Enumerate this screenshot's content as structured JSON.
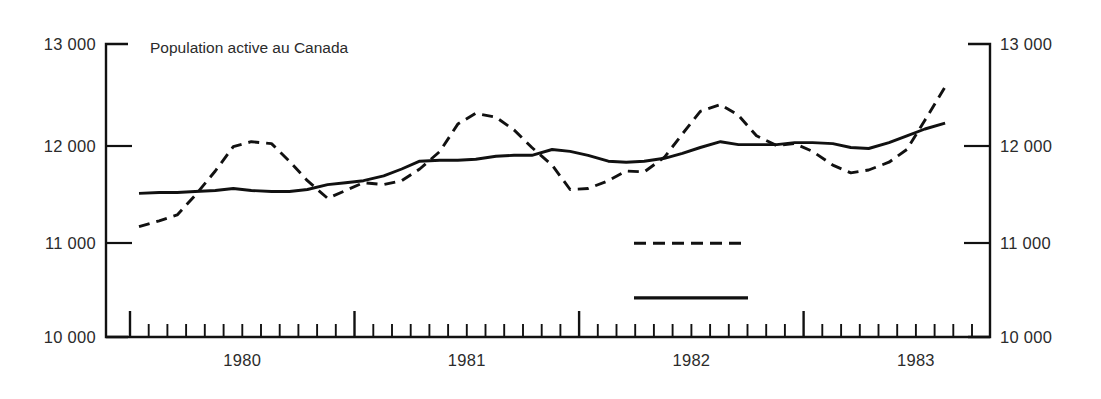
{
  "chart_data": {
    "type": "line",
    "title": "Population active au Canada",
    "xlabel": "",
    "ylabel": "",
    "ylim": [
      10000,
      13000
    ],
    "yticks": [
      10000,
      11000,
      12000,
      13000
    ],
    "ytick_labels": [
      "10 000",
      "11 000",
      "12 000",
      "13 000"
    ],
    "ytick_labels_right": [
      "10 000",
      "11 000",
      "12 000",
      "13 000"
    ],
    "xlim": [
      1979.5,
      1983.33
    ],
    "xticks": [
      1980,
      1981,
      1982,
      1983
    ],
    "xtick_labels": [
      "1980",
      "1981",
      "1982",
      "1983"
    ],
    "minor_tick_interval_months": 1,
    "year_boundary_ticks": [
      1979.5,
      1980.5,
      1981.5,
      1982.5,
      1983.33
    ],
    "grid": false,
    "legend_position": "inside-bottom-center",
    "legend_labels_visible": false,
    "series": [
      {
        "name": "donnees-brutes",
        "style": "dashed",
        "color": "#111111",
        "x": [
          1979.54,
          1979.63,
          1979.71,
          1979.79,
          1979.88,
          1979.96,
          1980.04,
          1980.13,
          1980.21,
          1980.29,
          1980.38,
          1980.46,
          1980.54,
          1980.63,
          1980.71,
          1980.79,
          1980.88,
          1980.96,
          1981.04,
          1981.13,
          1981.21,
          1981.29,
          1981.38,
          1981.46,
          1981.54,
          1981.63,
          1981.71,
          1981.79,
          1981.88,
          1981.96,
          1982.04,
          1982.13,
          1982.21,
          1982.29,
          1982.38,
          1982.46,
          1982.54,
          1982.63,
          1982.71,
          1982.79,
          1982.88,
          1982.96,
          1983.04,
          1983.13
        ],
        "values": [
          11130,
          11190,
          11250,
          11450,
          11700,
          11950,
          12000,
          11980,
          11800,
          11600,
          11420,
          11500,
          11580,
          11560,
          11600,
          11720,
          11900,
          12180,
          12290,
          12250,
          12120,
          11940,
          11760,
          11510,
          11520,
          11600,
          11700,
          11690,
          11840,
          12080,
          12310,
          12380,
          12270,
          12060,
          11960,
          11980,
          11900,
          11760,
          11680,
          11710,
          11790,
          11920,
          12220,
          12560
        ]
      },
      {
        "name": "tendance-cycle",
        "style": "solid",
        "color": "#111111",
        "x": [
          1979.54,
          1979.63,
          1979.71,
          1979.79,
          1979.88,
          1979.96,
          1980.04,
          1980.13,
          1980.21,
          1980.29,
          1980.38,
          1980.46,
          1980.54,
          1980.63,
          1980.71,
          1980.79,
          1980.88,
          1980.96,
          1981.04,
          1981.13,
          1981.21,
          1981.29,
          1981.38,
          1981.46,
          1981.54,
          1981.63,
          1981.71,
          1981.79,
          1981.88,
          1981.96,
          1982.04,
          1982.13,
          1982.21,
          1982.29,
          1982.38,
          1982.46,
          1982.54,
          1982.63,
          1982.71,
          1982.79,
          1982.88,
          1982.96,
          1983.04,
          1983.13
        ],
        "values": [
          11470,
          11480,
          11480,
          11490,
          11500,
          11520,
          11500,
          11490,
          11490,
          11510,
          11560,
          11580,
          11600,
          11650,
          11720,
          11800,
          11810,
          11810,
          11820,
          11850,
          11860,
          11860,
          11920,
          11900,
          11860,
          11800,
          11790,
          11800,
          11830,
          11880,
          11940,
          12000,
          11970,
          11970,
          11970,
          11990,
          11990,
          11980,
          11940,
          11930,
          11990,
          12060,
          12130,
          12190
        ]
      }
    ],
    "legend_samples": [
      {
        "style": "dashed",
        "y_value": 10960
      },
      {
        "style": "solid",
        "y_value": 10400
      }
    ]
  }
}
